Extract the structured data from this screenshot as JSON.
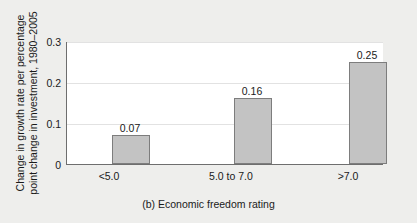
{
  "chart_data": {
    "type": "bar",
    "title": "",
    "caption": "(b) Economic freedom rating",
    "xlabel": "(b) Economic freedom rating",
    "ylabel_line1": "Change in growth rate per percentage",
    "ylabel_line2": "point change in investment, 1980–2005",
    "categories": [
      "<5.0",
      "5.0 to 7.0",
      ">7.0"
    ],
    "values": [
      0.07,
      0.16,
      0.25
    ],
    "value_labels": [
      "0.07",
      "0.16",
      "0.25"
    ],
    "ylim": [
      0,
      0.3
    ],
    "yticks": [
      0,
      0.1,
      0.2,
      0.3
    ],
    "ytick_labels": [
      "0",
      "0.1",
      "0.2",
      "0.3"
    ],
    "grid": true,
    "grid_axis": "y",
    "legend": false,
    "bar_fill_color": "#c3c3c3",
    "bar_edge_color": "#7d7d7d",
    "plot_background": "#ffffff",
    "figure_background": "#eeeeec",
    "axis_color": "#6e6e6e",
    "gridline_color": "#e2e2e2"
  }
}
